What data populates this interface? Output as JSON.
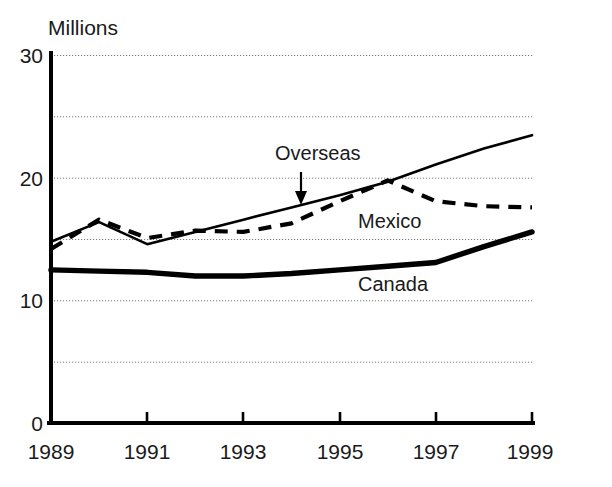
{
  "chart_data": {
    "type": "line",
    "title": "",
    "ylabel": "Millions",
    "xlabel": "",
    "x": [
      1989,
      1990,
      1991,
      1992,
      1993,
      1994,
      1995,
      1996,
      1997,
      1998,
      1999
    ],
    "xlim": [
      1989,
      1999
    ],
    "ylim": [
      0,
      30
    ],
    "yticks": [
      0,
      10,
      20,
      30
    ],
    "ytick_labels": [
      "0",
      "10",
      "20",
      "30"
    ],
    "xticks": [
      1989,
      1991,
      1993,
      1995,
      1997,
      1999
    ],
    "xtick_labels": [
      "1989",
      "1991",
      "1993",
      "1995",
      "1997",
      "1999"
    ],
    "gridlines_y": [
      5,
      10,
      15,
      20,
      25,
      30
    ],
    "grid": true,
    "legend": "inline-labels",
    "series": [
      {
        "name": "Overseas",
        "style": "thin-solid",
        "values": [
          14.8,
          16.4,
          14.6,
          15.6,
          16.6,
          17.6,
          18.6,
          19.7,
          21.1,
          22.4,
          23.5
        ]
      },
      {
        "name": "Mexico",
        "style": "dashed",
        "values": [
          14.2,
          16.6,
          15.1,
          15.7,
          15.6,
          16.3,
          18.1,
          19.8,
          18.1,
          17.7,
          17.6
        ]
      },
      {
        "name": "Canada",
        "style": "thick-solid",
        "values": [
          12.5,
          12.4,
          12.3,
          12.0,
          12.0,
          12.2,
          12.5,
          12.8,
          13.1,
          14.4,
          15.6
        ]
      }
    ],
    "annotations": [
      {
        "name": "overseas-pointer",
        "text": "Overseas",
        "points_to_series": "Overseas",
        "points_to_x": 1994
      },
      {
        "name": "mexico-label",
        "text": "Mexico"
      },
      {
        "name": "canada-label",
        "text": "Canada"
      }
    ],
    "colors": {
      "line": "#000000",
      "grid": "#7a7a7a",
      "background": "#ffffff",
      "text": "#1a1a1a"
    }
  }
}
